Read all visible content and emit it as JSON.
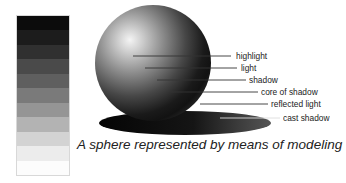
{
  "figure": {
    "caption": "A sphere represented by means of modeling",
    "value_scale": {
      "steps": [
        "#0c0c0c",
        "#1a1a1a",
        "#2e2e2e",
        "#4a4a4a",
        "#5e5e5e",
        "#7a7a7a",
        "#959595",
        "#b3b3b3",
        "#d3d3d3",
        "#ececec",
        "#fbfbfb"
      ]
    },
    "labels": [
      {
        "text": "highlight",
        "x": 233,
        "y": 52
      },
      {
        "text": "light",
        "x": 239,
        "y": 64
      },
      {
        "text": "shadow",
        "x": 248,
        "y": 76
      },
      {
        "text": "core of shadow",
        "x": 260,
        "y": 89
      },
      {
        "text": "reflected light",
        "x": 270,
        "y": 101
      },
      {
        "text": "cast shadow",
        "x": 282,
        "y": 114
      }
    ],
    "colors": {
      "background": "#ffffff",
      "text": "#222222",
      "line": "#333333"
    }
  }
}
